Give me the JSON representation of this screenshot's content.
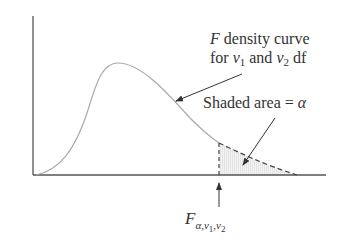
{
  "diagram": {
    "curve_label_line1_var": "F",
    "curve_label_line1_text": " density curve",
    "curve_label_line2_for": "for ",
    "nu": "ν",
    "sub1": "1",
    "sub2": "2",
    "and_text": " and ",
    "df_text": " df",
    "shaded_label": "Shaded area = ",
    "alpha": "α",
    "critical_var": "F",
    "critical_sub_alpha": "α,",
    "critical_sub_nu1": "ν",
    "critical_sub_nu1_idx": "1",
    "critical_sub_comma": ",",
    "critical_sub_nu2": "ν",
    "critical_sub_nu2_idx": "2",
    "colors": {
      "axis": "#555555",
      "curve": "#aaaaaa",
      "dashed": "#444444",
      "shade": "#ececec",
      "arrow": "#333333"
    }
  }
}
